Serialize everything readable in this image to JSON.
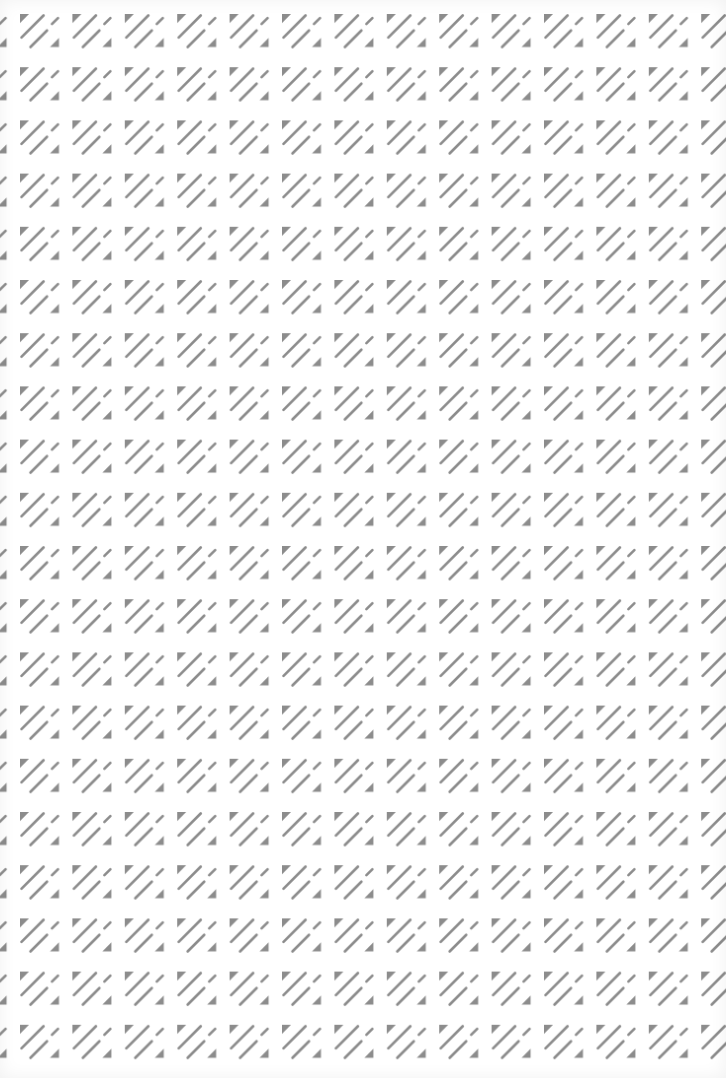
{
  "pattern": {
    "name": "diagonal-stripes-with-triangles",
    "fill_color": "#8c8c8c",
    "background_color": "#ffffff",
    "tile_width": 52.4,
    "tile_height": 53.2,
    "offset_x": 20,
    "offset_y": 14,
    "columns": 14,
    "rows": 20,
    "elements": [
      "top-left-triangle",
      "long-diagonal-stroke",
      "short-diagonal-stroke",
      "lower-diagonal-stroke",
      "bottom-right-triangle"
    ]
  }
}
